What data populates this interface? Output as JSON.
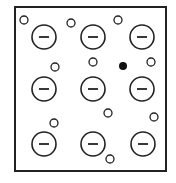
{
  "diagram": {
    "frame": {
      "x": 15,
      "y": 7,
      "width": 151,
      "height": 164,
      "stroke": "#222222"
    },
    "negative_ions": {
      "radius": 12,
      "symbol": "minus",
      "items": [
        {
          "x": 44,
          "y": 37
        },
        {
          "x": 93,
          "y": 37
        },
        {
          "x": 142,
          "y": 37
        },
        {
          "x": 44,
          "y": 89
        },
        {
          "x": 93,
          "y": 89
        },
        {
          "x": 142,
          "y": 89
        },
        {
          "x": 44,
          "y": 144
        },
        {
          "x": 93,
          "y": 144
        },
        {
          "x": 143,
          "y": 144
        }
      ]
    },
    "small_particles": {
      "radius": 4,
      "items": [
        {
          "x": 24,
          "y": 20
        },
        {
          "x": 71,
          "y": 23
        },
        {
          "x": 118,
          "y": 20
        },
        {
          "x": 55,
          "y": 67
        },
        {
          "x": 93,
          "y": 62
        },
        {
          "x": 151,
          "y": 62
        },
        {
          "x": 54,
          "y": 123
        },
        {
          "x": 108,
          "y": 113
        },
        {
          "x": 154,
          "y": 117
        },
        {
          "x": 110,
          "y": 159
        }
      ]
    },
    "filled_particle": {
      "x": 123,
      "y": 66,
      "radius": 4,
      "fill": "#111111"
    }
  }
}
